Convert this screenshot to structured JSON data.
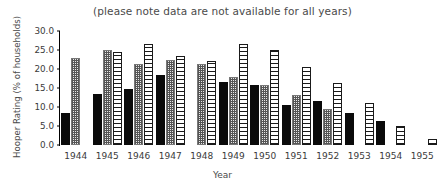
{
  "chart_data": {
    "type": "bar",
    "title": "(please note data are not available for all years)",
    "xlabel": "Year",
    "ylabel": "Hooper Rating (% of households)",
    "categories": [
      "1944",
      "1945",
      "1946",
      "1947",
      "1948",
      "1949",
      "1950",
      "1951",
      "1952",
      "1953",
      "1954",
      "1955"
    ],
    "ylim": [
      0.0,
      30.0
    ],
    "yticks": [
      "0.0",
      "5.0",
      "10.0",
      "15.0",
      "20.0",
      "25.0",
      "30.0"
    ],
    "ytick_values": [
      0.0,
      5.0,
      10.0,
      15.0,
      20.0,
      25.0,
      30.0
    ],
    "grid": false,
    "legend": "none",
    "series": [
      {
        "name": "series-1-black",
        "fill": "solid-black",
        "color": "#0a0a0a",
        "values": [
          8.5,
          13.3,
          14.8,
          18.3,
          null,
          16.7,
          15.9,
          10.6,
          11.7,
          8.4,
          6.3,
          null
        ]
      },
      {
        "name": "series-2-gray-dotted",
        "fill": "dotted-gray",
        "color": "#888888",
        "values": [
          23.0,
          25.0,
          21.2,
          22.5,
          21.4,
          17.8,
          15.8,
          13.2,
          9.5,
          null,
          null,
          null
        ]
      },
      {
        "name": "series-3-white-hatched",
        "fill": "hatched-white",
        "color": "#ffffff",
        "values": [
          null,
          24.5,
          26.5,
          23.3,
          22.0,
          26.5,
          25.0,
          20.5,
          16.3,
          11.0,
          5.0,
          1.5
        ]
      }
    ]
  }
}
